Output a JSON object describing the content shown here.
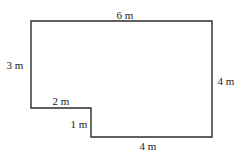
{
  "figure": {
    "type": "composite-rectilinear-shape",
    "stroke_color": "#2b2b2b",
    "fill_color": "#ffffff",
    "vertices": [
      [
        31,
        21
      ],
      [
        212,
        21
      ],
      [
        212,
        137
      ],
      [
        91,
        137
      ],
      [
        91,
        108
      ],
      [
        31,
        108
      ]
    ],
    "labels": {
      "top": "6 m",
      "left": "3 m",
      "right": "4 m",
      "notch_top": "2 m",
      "notch_side": "1 m",
      "bottom": "4 m"
    }
  }
}
